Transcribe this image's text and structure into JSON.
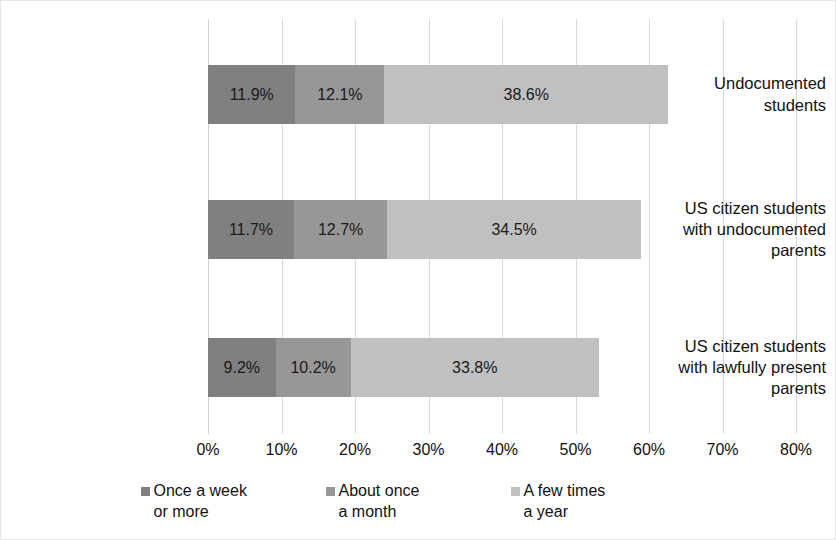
{
  "chart_data": {
    "type": "bar",
    "orientation": "horizontal",
    "stacked": true,
    "title": "",
    "xlabel": "",
    "ylabel": "",
    "xlim": [
      0,
      80
    ],
    "xtick_labels": [
      "0%",
      "10%",
      "20%",
      "30%",
      "40%",
      "50%",
      "60%",
      "70%",
      "80%"
    ],
    "xticks": [
      0,
      10,
      20,
      30,
      40,
      50,
      60,
      70,
      80
    ],
    "grid": "vertical",
    "legend_position": "bottom",
    "categories": [
      "Undocumented\nstudents",
      "US citizen students\nwith undocumented\nparents",
      "US citizen students\nwith lawfully present\nparents"
    ],
    "series": [
      {
        "name": "Once a week\nor more",
        "color": "#808080",
        "values": [
          11.9,
          11.7,
          9.2
        ],
        "labels": [
          "11.9%",
          "11.7%",
          "9.2%"
        ]
      },
      {
        "name": "About once\na month",
        "color": "#979797",
        "values": [
          12.1,
          12.7,
          10.2
        ],
        "labels": [
          "12.1%",
          "12.7%",
          "10.2%"
        ]
      },
      {
        "name": "A few times\na year",
        "color": "#c0c0c0",
        "values": [
          38.6,
          34.5,
          33.8
        ],
        "labels": [
          "38.6%",
          "34.5%",
          "33.8%"
        ]
      }
    ],
    "totals": [
      62.6,
      58.9,
      53.2
    ]
  },
  "colors": {
    "gridline": "#d9d9d9",
    "border": "#e6e6e6",
    "text": "#111111",
    "background": "#ffffff"
  }
}
